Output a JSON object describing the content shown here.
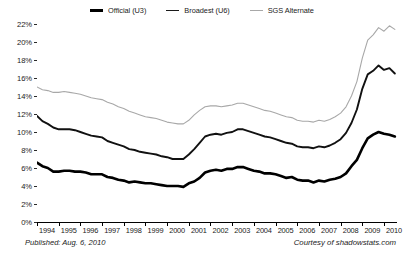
{
  "footer": {
    "published": "Published: Aug. 6, 2010",
    "courtesy": "Courtesy of shadowstats.com"
  },
  "chart_data": {
    "type": "line",
    "title": "",
    "subtitle": "",
    "xlabel": "",
    "ylabel": "",
    "grid": false,
    "legend_position": "top-center",
    "xlim": [
      1994.0,
      2010.6
    ],
    "ylim": [
      0,
      22
    ],
    "y_tick_labels": [
      "22%",
      "20%",
      "18%",
      "16%",
      "14%",
      "12%",
      "10%",
      "8%",
      "6%",
      "4%",
      "2%",
      "0%"
    ],
    "y_ticks": [
      22,
      20,
      18,
      16,
      14,
      12,
      10,
      8,
      6,
      4,
      2,
      0
    ],
    "x_tick_labels": [
      "1994",
      "1995",
      "1996",
      "1997",
      "1998",
      "1999",
      "2000",
      "2001",
      "2002",
      "2003",
      "2004",
      "2005",
      "2006",
      "2007",
      "2008",
      "2009",
      "2010"
    ],
    "x_ticks": [
      1994,
      1995,
      1996,
      1997,
      1998,
      1999,
      2000,
      2001,
      2002,
      2003,
      2004,
      2005,
      2006,
      2007,
      2008,
      2009,
      2010
    ],
    "colors": {
      "official_u3": "#000000",
      "broadest_u6": "#111111",
      "sgs_alternate": "#a8a8a8"
    },
    "series": [
      {
        "name": "Official (U3)",
        "color": "#000000",
        "width": 2.6,
        "x": [
          1994.0,
          1994.25,
          1994.5,
          1994.75,
          1995.0,
          1995.25,
          1995.5,
          1995.75,
          1996.0,
          1996.25,
          1996.5,
          1996.75,
          1997.0,
          1997.25,
          1997.5,
          1997.75,
          1998.0,
          1998.25,
          1998.5,
          1998.75,
          1999.0,
          1999.25,
          1999.5,
          1999.75,
          2000.0,
          2000.25,
          2000.5,
          2000.75,
          2001.0,
          2001.25,
          2001.5,
          2001.75,
          2002.0,
          2002.25,
          2002.5,
          2002.75,
          2003.0,
          2003.25,
          2003.5,
          2003.75,
          2004.0,
          2004.25,
          2004.5,
          2004.75,
          2005.0,
          2005.25,
          2005.5,
          2005.75,
          2006.0,
          2006.25,
          2006.5,
          2006.75,
          2007.0,
          2007.25,
          2007.5,
          2007.75,
          2008.0,
          2008.25,
          2008.5,
          2008.75,
          2009.0,
          2009.25,
          2009.5,
          2009.75,
          2010.0,
          2010.25,
          2010.5
        ],
        "values": [
          6.6,
          6.2,
          6.0,
          5.6,
          5.6,
          5.7,
          5.7,
          5.6,
          5.6,
          5.5,
          5.3,
          5.3,
          5.3,
          5.0,
          4.9,
          4.7,
          4.6,
          4.4,
          4.5,
          4.4,
          4.3,
          4.3,
          4.2,
          4.1,
          4.0,
          4.0,
          4.0,
          3.9,
          4.3,
          4.5,
          4.9,
          5.5,
          5.7,
          5.8,
          5.7,
          5.9,
          5.9,
          6.1,
          6.1,
          5.9,
          5.7,
          5.6,
          5.4,
          5.4,
          5.3,
          5.1,
          4.9,
          5.0,
          4.7,
          4.6,
          4.6,
          4.4,
          4.6,
          4.5,
          4.7,
          4.8,
          5.0,
          5.4,
          6.2,
          6.9,
          8.2,
          9.3,
          9.7,
          10.0,
          9.8,
          9.7,
          9.5
        ]
      },
      {
        "name": "Broadest (U6)",
        "color": "#111111",
        "width": 1.9,
        "x": [
          1994.0,
          1994.25,
          1994.5,
          1994.75,
          1995.0,
          1995.25,
          1995.5,
          1995.75,
          1996.0,
          1996.25,
          1996.5,
          1996.75,
          1997.0,
          1997.25,
          1997.5,
          1997.75,
          1998.0,
          1998.25,
          1998.5,
          1998.75,
          1999.0,
          1999.25,
          1999.5,
          1999.75,
          2000.0,
          2000.25,
          2000.5,
          2000.75,
          2001.0,
          2001.25,
          2001.5,
          2001.75,
          2002.0,
          2002.25,
          2002.5,
          2002.75,
          2003.0,
          2003.25,
          2003.5,
          2003.75,
          2004.0,
          2004.25,
          2004.5,
          2004.75,
          2005.0,
          2005.25,
          2005.5,
          2005.75,
          2006.0,
          2006.25,
          2006.5,
          2006.75,
          2007.0,
          2007.25,
          2007.5,
          2007.75,
          2008.0,
          2008.25,
          2008.5,
          2008.75,
          2009.0,
          2009.25,
          2009.5,
          2009.75,
          2010.0,
          2010.25,
          2010.5
        ],
        "values": [
          11.8,
          11.2,
          10.9,
          10.5,
          10.3,
          10.3,
          10.3,
          10.2,
          10.0,
          9.8,
          9.6,
          9.5,
          9.4,
          9.0,
          8.8,
          8.6,
          8.4,
          8.1,
          8.0,
          7.8,
          7.7,
          7.6,
          7.5,
          7.3,
          7.2,
          7.0,
          7.0,
          7.0,
          7.5,
          8.1,
          8.8,
          9.5,
          9.7,
          9.8,
          9.7,
          9.9,
          10.0,
          10.3,
          10.3,
          10.1,
          9.9,
          9.7,
          9.5,
          9.4,
          9.2,
          9.0,
          8.8,
          8.7,
          8.4,
          8.3,
          8.3,
          8.2,
          8.4,
          8.3,
          8.5,
          8.8,
          9.2,
          9.9,
          11.0,
          12.5,
          14.8,
          16.4,
          16.8,
          17.4,
          16.9,
          17.1,
          16.5
        ]
      },
      {
        "name": "SGS Alternate",
        "color": "#a8a8a8",
        "width": 1.1,
        "x": [
          1994.0,
          1994.25,
          1994.5,
          1994.75,
          1995.0,
          1995.25,
          1995.5,
          1995.75,
          1996.0,
          1996.25,
          1996.5,
          1996.75,
          1997.0,
          1997.25,
          1997.5,
          1997.75,
          1998.0,
          1998.25,
          1998.5,
          1998.75,
          1999.0,
          1999.25,
          1999.5,
          1999.75,
          2000.0,
          2000.25,
          2000.5,
          2000.75,
          2001.0,
          2001.25,
          2001.5,
          2001.75,
          2002.0,
          2002.25,
          2002.5,
          2002.75,
          2003.0,
          2003.25,
          2003.5,
          2003.75,
          2004.0,
          2004.25,
          2004.5,
          2004.75,
          2005.0,
          2005.25,
          2005.5,
          2005.75,
          2006.0,
          2006.25,
          2006.5,
          2006.75,
          2007.0,
          2007.25,
          2007.5,
          2007.75,
          2008.0,
          2008.25,
          2008.5,
          2008.75,
          2009.0,
          2009.25,
          2009.5,
          2009.75,
          2010.0,
          2010.25,
          2010.5
        ],
        "values": [
          15.0,
          14.7,
          14.6,
          14.4,
          14.4,
          14.5,
          14.4,
          14.3,
          14.2,
          14.0,
          13.8,
          13.7,
          13.6,
          13.3,
          13.1,
          12.8,
          12.6,
          12.3,
          12.1,
          11.9,
          11.7,
          11.6,
          11.5,
          11.3,
          11.1,
          11.0,
          10.9,
          10.9,
          11.3,
          11.9,
          12.4,
          12.8,
          12.9,
          12.9,
          12.8,
          12.9,
          13.0,
          13.2,
          13.2,
          13.0,
          12.8,
          12.6,
          12.4,
          12.3,
          12.1,
          11.9,
          11.7,
          11.6,
          11.3,
          11.2,
          11.2,
          11.1,
          11.3,
          11.2,
          11.4,
          11.7,
          12.1,
          12.8,
          14.0,
          15.6,
          18.2,
          20.2,
          20.8,
          21.6,
          21.2,
          21.8,
          21.4
        ]
      }
    ],
    "legend": [
      {
        "label": "Official (U3)",
        "icon": "line-swatch-u3"
      },
      {
        "label": "Broadest (U6)",
        "icon": "line-swatch-u6"
      },
      {
        "label": "SGS Alternate",
        "icon": "line-swatch-sgs"
      }
    ]
  }
}
